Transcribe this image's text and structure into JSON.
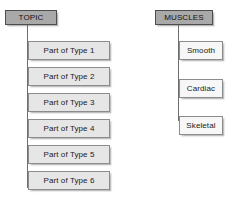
{
  "diagram": {
    "background_color": "#ffffff",
    "line_color": "#6e6e6e",
    "root_fill_color": "#a9a9a9",
    "root_border_color": "#4d4d4d",
    "child_fill_color": "#e6e6e6",
    "child_light_fill_color": "#f7f7f7",
    "child_border_color": "#8c8c8c",
    "branches": [
      {
        "id": "topic-branch",
        "root": {
          "label": "TOPIC"
        },
        "children": [
          {
            "label": "Part of Type 1"
          },
          {
            "label": "Part of Type 2"
          },
          {
            "label": "Part of Type 3"
          },
          {
            "label": "Part of Type 4"
          },
          {
            "label": "Part of Type 5"
          },
          {
            "label": "Part of Type 6"
          }
        ]
      },
      {
        "id": "muscles-branch",
        "root": {
          "label": "MUSCLES"
        },
        "children": [
          {
            "label": "Smooth"
          },
          {
            "label": "Cardiac"
          },
          {
            "label": "Skeletal"
          }
        ]
      }
    ]
  }
}
